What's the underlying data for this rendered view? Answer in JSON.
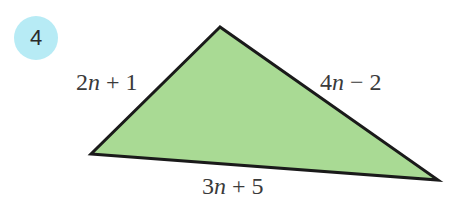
{
  "problem": {
    "number": "4",
    "badge_color": "#b7ebf5"
  },
  "triangle": {
    "fill_color": "#a9da94",
    "stroke_color": "#1a1a1a",
    "vertices": {
      "top": [
        220,
        27
      ],
      "left": [
        91,
        154
      ],
      "right": [
        438,
        180
      ]
    },
    "sides": {
      "left": {
        "coef": "2",
        "var": "n",
        "op": "+",
        "const": "1"
      },
      "right": {
        "coef": "4",
        "var": "n",
        "op": "−",
        "const": "2"
      },
      "bottom": {
        "coef": "3",
        "var": "n",
        "op": "+",
        "const": "5"
      }
    }
  }
}
